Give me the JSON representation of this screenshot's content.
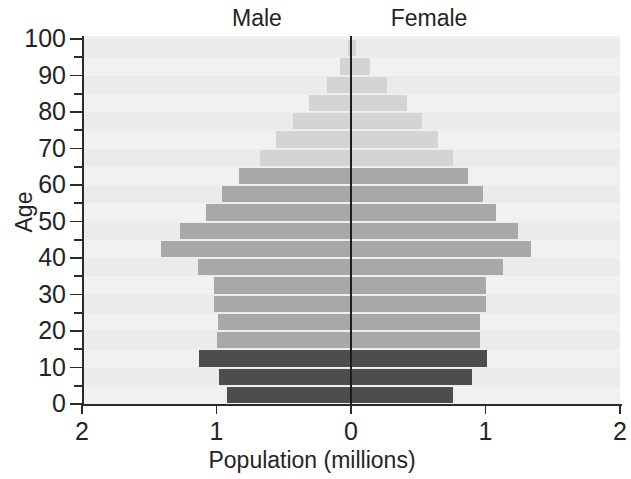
{
  "chart_data": {
    "type": "bar",
    "subtype": "population-pyramid",
    "title": "",
    "xlabel": "Population (millions)",
    "ylabel": "Age",
    "series_labels": {
      "left": "Male",
      "right": "Female"
    },
    "x_tick_labels": [
      "2",
      "1",
      "0",
      "1",
      "2"
    ],
    "x_tick_values": [
      -2,
      -1,
      0,
      1,
      2
    ],
    "xlim": [
      -2,
      2
    ],
    "y_tick_labels": [
      "0",
      "10",
      "20",
      "30",
      "40",
      "50",
      "60",
      "70",
      "80",
      "90",
      "100"
    ],
    "ylim": [
      0,
      102
    ],
    "grid": false,
    "age_group_width": 5,
    "categories": [
      "0-5",
      "5-10",
      "10-15",
      "15-20",
      "20-25",
      "25-30",
      "30-35",
      "35-40",
      "40-45",
      "45-50",
      "50-55",
      "55-60",
      "60-65",
      "65-70",
      "70-75",
      "75-80",
      "80-85",
      "85-90",
      "90-95",
      "95-100",
      "100+"
    ],
    "series": [
      {
        "name": "Male",
        "side": "left",
        "values": [
          0.92,
          0.98,
          1.13,
          1.0,
          0.99,
          1.02,
          1.02,
          1.14,
          1.41,
          1.27,
          1.08,
          0.96,
          0.83,
          0.68,
          0.56,
          0.43,
          0.31,
          0.18,
          0.08,
          0.02,
          0.0
        ]
      },
      {
        "name": "Female",
        "side": "right",
        "values": [
          0.76,
          0.9,
          1.01,
          0.96,
          0.96,
          1.0,
          1.0,
          1.13,
          1.34,
          1.24,
          1.08,
          0.98,
          0.87,
          0.76,
          0.65,
          0.53,
          0.42,
          0.27,
          0.14,
          0.04,
          0.01
        ]
      }
    ],
    "band_colors": {
      "children": "#4d4d4d",
      "working_age": "#a8a8a8",
      "elderly": "#d4d4d4"
    },
    "band_assignment": [
      "children",
      "children",
      "children",
      "working_age",
      "working_age",
      "working_age",
      "working_age",
      "working_age",
      "working_age",
      "working_age",
      "working_age",
      "working_age",
      "working_age",
      "elderly",
      "elderly",
      "elderly",
      "elderly",
      "elderly",
      "elderly",
      "elderly",
      "elderly"
    ],
    "plot_background": "#eeeeee",
    "axis_color": "#2b2b2b"
  }
}
